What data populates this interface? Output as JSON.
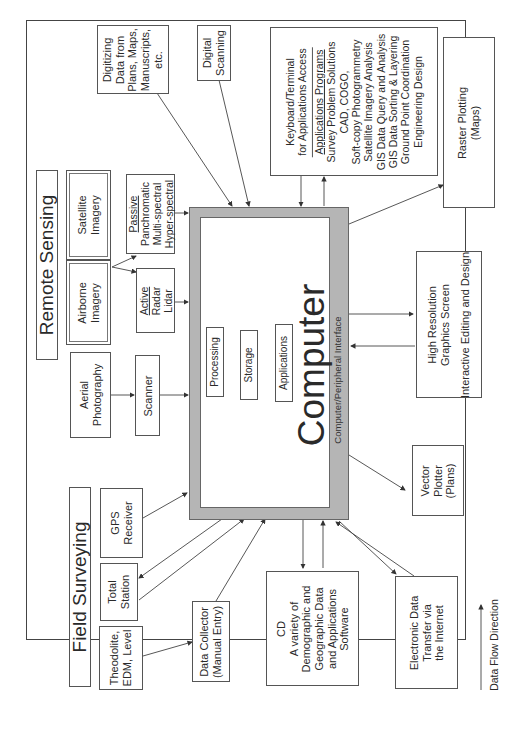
{
  "diagram": {
    "orientation": "rotated 90 degrees counter-clockwise",
    "sections": {
      "remote_sensing": {
        "title": "Remote Sensing"
      },
      "field_surveying": {
        "title": "Field Surveying"
      }
    },
    "computer": {
      "title": "Computer",
      "interface_label": "Computer/Peripheral Interface",
      "internal": {
        "processing": "Processing",
        "storage": "Storage",
        "applications": "Applications"
      }
    },
    "nodes": {
      "digitizing": [
        "Digitizing",
        "Data from",
        "Plans, Maps,",
        "Manuscripts,",
        "etc."
      ],
      "digital_scanning": [
        "Digital",
        "Scanning"
      ],
      "satellite_imagery": [
        "Satellite",
        "Imagery"
      ],
      "airborne_imagery": [
        "Airborne",
        "Imagery"
      ],
      "passive": {
        "heading": "Passive",
        "lines": [
          "Panchromatic",
          "Multi-spectral",
          "Hyper-spectral"
        ]
      },
      "active": {
        "heading": "Active",
        "lines": [
          "Radar",
          "Lidar"
        ]
      },
      "aerial_photography": [
        "Aerial",
        "Photography"
      ],
      "scanner": [
        "Scanner"
      ],
      "gps_receiver": [
        "GPS",
        "Receiver"
      ],
      "total_station": [
        "Total",
        "Station"
      ],
      "theodolite": [
        "Theodolite,",
        "EDM, Level"
      ],
      "data_collector": [
        "Data Collector",
        "(Manual Entry)"
      ],
      "keyboard": {
        "header": [
          "Keyboard/Terminal",
          "for Applications Access"
        ],
        "subheading": "Applications Programs",
        "programs": [
          "Survey Problem Solutions",
          "CAD, COGO,",
          "Soft-copy Photogrammetry",
          "Satellite Imagery Analysis",
          "GIS Data Query and Analysis",
          "GIS Data Sorting & Layering",
          "Ground Point Coordination",
          "Engineering Design"
        ]
      },
      "raster_plotting": [
        "Raster Plotting",
        "(Maps)"
      ],
      "graphics_screen": [
        "High Resolution",
        "Graphics Screen",
        "",
        "Interactive Editing and Design"
      ],
      "vector_plotter": [
        "Vector",
        "Plotter",
        "(Plans)"
      ],
      "cd": [
        "CD",
        "A variety of",
        "Demographic and",
        "Geographic Data",
        "and Applications",
        "Software"
      ],
      "electronic_transfer": [
        "Electronic Data",
        "Transfer via",
        "the Internet"
      ]
    },
    "legend": {
      "label": "Data Flow Direction"
    }
  }
}
